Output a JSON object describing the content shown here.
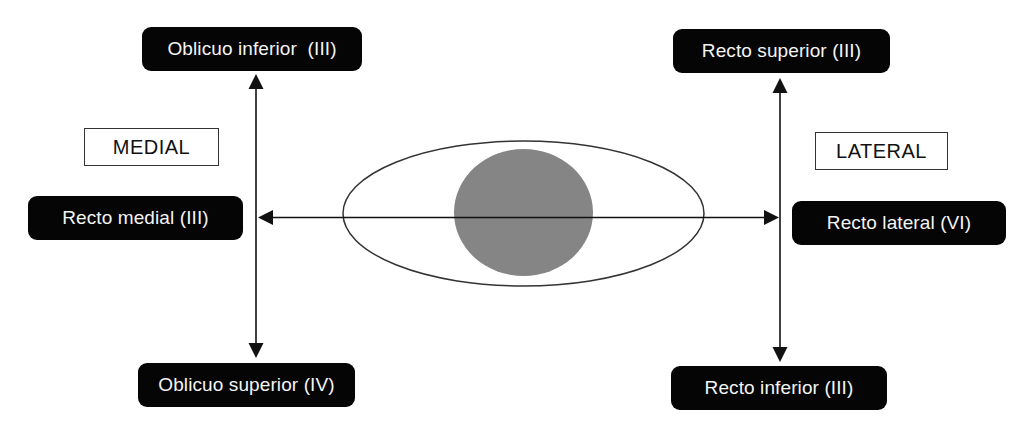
{
  "diagram": {
    "title": "",
    "direction_labels": {
      "medial": "MEDIAL",
      "lateral": "LATERAL"
    },
    "muscles": {
      "oblicuo_inferior": {
        "label": "Oblicuo inferior  (III)",
        "position": "top-left",
        "action": "up"
      },
      "recto_medial": {
        "label": "Recto medial (III)",
        "position": "middle-left",
        "action": "medial"
      },
      "oblicuo_superior": {
        "label": "Oblicuo superior (IV)",
        "position": "bottom-left",
        "action": "down"
      },
      "recto_superior": {
        "label": "Recto superior (III)",
        "position": "top-right",
        "action": "up"
      },
      "recto_lateral": {
        "label": "Recto lateral (VI)",
        "position": "middle-right",
        "action": "lateral"
      },
      "recto_inferior": {
        "label": "Recto inferior (III)",
        "position": "bottom-right",
        "action": "down"
      }
    },
    "eye": {
      "sclera_fill": "#ffffff",
      "iris_fill": "#858585",
      "stroke": "#333333"
    },
    "colors": {
      "box_fill": "#050505",
      "box_text": "#f4f4f4",
      "line": "#111111"
    }
  }
}
